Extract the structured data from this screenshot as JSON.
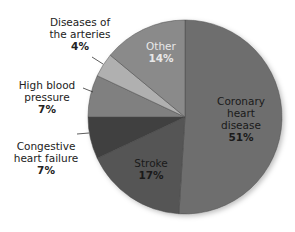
{
  "chart_data": {
    "type": "pie",
    "title": "",
    "start_angle_deg": 0,
    "direction": "clockwise",
    "slices": [
      {
        "label": "Coronary heart disease",
        "value": 51,
        "display": "51%",
        "color": "#6e6e6e"
      },
      {
        "label": "Stroke",
        "value": 17,
        "display": "17%",
        "color": "#545454"
      },
      {
        "label": "Congestive heart failure",
        "value": 7,
        "display": "7%",
        "color": "#3f3f3f"
      },
      {
        "label": "High blood pressure",
        "value": 7,
        "display": "7%",
        "color": "#808080"
      },
      {
        "label": "Diseases of the arteries",
        "value": 4,
        "display": "4%",
        "color": "#b0b0b0"
      },
      {
        "label": "Other",
        "value": 14,
        "display": "14%",
        "color": "#8a8a8a"
      }
    ]
  },
  "labels": {
    "coronary": {
      "line1": "Coronary",
      "line2": "heart",
      "line3": "disease",
      "pct": "51%"
    },
    "stroke": {
      "line1": "Stroke",
      "pct": "17%"
    },
    "chf": {
      "line1": "Congestive",
      "line2": "heart failure",
      "pct": "7%"
    },
    "hbp": {
      "line1": "High blood",
      "line2": "pressure",
      "pct": "7%"
    },
    "arteries": {
      "line1": "Diseases of",
      "line2": "the arteries",
      "pct": "4%"
    },
    "other": {
      "line1": "Other",
      "pct": "14%"
    }
  }
}
